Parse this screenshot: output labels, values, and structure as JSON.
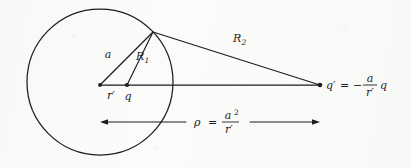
{
  "figure": {
    "type": "geometric-diagram",
    "background_color": "#fbfbfa",
    "ink_color": "#1d1d1d"
  },
  "labels": {
    "radius_a": "a",
    "R1": "R",
    "R1_sub": "1",
    "R2": "R",
    "R2_sub": "2",
    "r_prime": "r′",
    "q": "q",
    "q_prime": "q′",
    "equals": "=",
    "minus": "−",
    "frac_a": "a",
    "frac_rprime": "r′",
    "q_tail": "q",
    "rho": "ρ",
    "rho_equals": "=",
    "rho_num": "a",
    "rho_num_exp": "2",
    "rho_den": "r′"
  },
  "geometry": {
    "circle": {
      "cx": 100,
      "cy": 82,
      "r": 73
    },
    "points": {
      "center": {
        "x": 100,
        "y": 85,
        "name": "sphere-center"
      },
      "q": {
        "x": 127,
        "y": 85,
        "name": "source-charge-q"
      },
      "surface": {
        "x": 153,
        "y": 32,
        "name": "surface-point"
      },
      "q_prime": {
        "x": 320,
        "y": 85,
        "name": "image-charge-q-prime"
      }
    },
    "segments": [
      {
        "name": "segment-a",
        "from": "center",
        "to": "surface"
      },
      {
        "name": "segment-R1",
        "from": "q",
        "to": "surface"
      },
      {
        "name": "segment-R2",
        "from": "surface",
        "to": "q_prime"
      },
      {
        "name": "axis-line",
        "from": "center",
        "to": "q_prime"
      }
    ],
    "rho_arrow": {
      "x1": 100,
      "x2": 320,
      "y": 122,
      "double_headed": true
    }
  },
  "equations": {
    "image_charge": "q′ = − (a / r′) q",
    "rho": "ρ = a² / r′"
  }
}
